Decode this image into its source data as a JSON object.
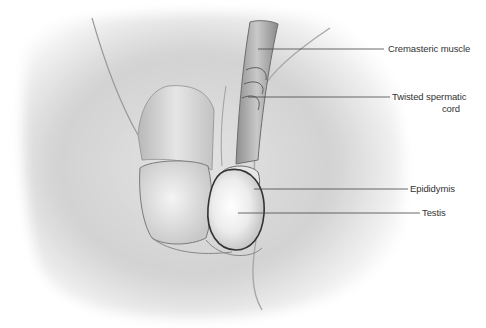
{
  "figure": {
    "style": "grayscale medical illustration",
    "colors": {
      "background": "#ffffff",
      "skin_light": "#f2f2f2",
      "skin_mid": "#d6d6d6",
      "skin_dark": "#9a9a9a",
      "outline": "#555555",
      "leader_line": "#444444",
      "label_text": "#333333"
    }
  },
  "labels": [
    {
      "id": "cremasteric-muscle",
      "text": "Cremasteric muscle",
      "line": {
        "x1": 258,
        "y1": 49,
        "x2": 384,
        "y2": 49
      }
    },
    {
      "id": "twisted-spermatic-cord",
      "text_line1": "Twisted spermatic",
      "text_line2": "cord",
      "line": {
        "x1": 248,
        "y1": 97,
        "x2": 390,
        "y2": 97
      }
    },
    {
      "id": "epididymis",
      "text": "Epididymis",
      "line": {
        "x1": 254,
        "y1": 189,
        "x2": 408,
        "y2": 189
      }
    },
    {
      "id": "testis",
      "text": "Testis",
      "line": {
        "x1": 238,
        "y1": 213,
        "x2": 420,
        "y2": 213
      }
    }
  ]
}
